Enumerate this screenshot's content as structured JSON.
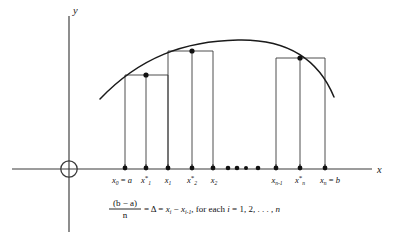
{
  "figure": {
    "axes": {
      "y_label": "y",
      "x_label": "x",
      "origin_marker": "open-circle"
    },
    "colors": {
      "background": "#ffffff",
      "ink": "#111111",
      "axis": "#3a3a3a",
      "rectangle_stroke": "#3b3b3b"
    },
    "tick_labels": [
      {
        "id": "x0",
        "base": "x",
        "sub": "0",
        "star": false,
        "relation": " = ",
        "value": "a",
        "x": 122
      },
      {
        "id": "x1star",
        "base": "x",
        "sub": "1",
        "star": true,
        "relation": "",
        "value": "",
        "x": 146
      },
      {
        "id": "x1",
        "base": "x",
        "sub": "1",
        "star": false,
        "relation": "",
        "value": "",
        "x": 169
      },
      {
        "id": "x2star",
        "base": "x",
        "sub": "2",
        "star": true,
        "relation": "",
        "value": "",
        "x": 192
      },
      {
        "id": "x2",
        "base": "x",
        "sub": "2",
        "star": false,
        "relation": "",
        "value": "",
        "x": 214
      },
      {
        "id": "xn-1",
        "base": "x",
        "sub": "n-1",
        "star": false,
        "relation": "",
        "value": "",
        "x": 277
      },
      {
        "id": "xnstar",
        "base": "x",
        "sub": "n",
        "star": true,
        "relation": "",
        "value": "",
        "x": 300
      },
      {
        "id": "xn",
        "base": "x",
        "sub": "n",
        "star": false,
        "relation": " = ",
        "value": "b",
        "x": 328
      }
    ],
    "ellipsis_dots": [
      {
        "x": 228
      },
      {
        "x": 236
      },
      {
        "x": 244
      },
      {
        "x": 255
      }
    ],
    "rectangles": [
      {
        "id": "rect-1",
        "left": 125,
        "right": 168,
        "top": 75,
        "midpoint_x": 146
      },
      {
        "id": "rect-2",
        "left": 168,
        "right": 213,
        "top": 51,
        "midpoint_x": 192
      },
      {
        "id": "rect-3",
        "left": 276,
        "right": 325,
        "top": 58,
        "midpoint_x": 300
      }
    ],
    "formula": {
      "numerator": "(b − a)",
      "denominator": "n",
      "body_1": " = Δ = ",
      "x_i": "x",
      "x_i_sub": "i",
      "minus": " − ",
      "x_im1": "x",
      "x_im1_sub": "i-1",
      "body_2": ", for each ",
      "index": "i",
      "equals": " = 1, 2, . . . , ",
      "n": "n"
    }
  }
}
